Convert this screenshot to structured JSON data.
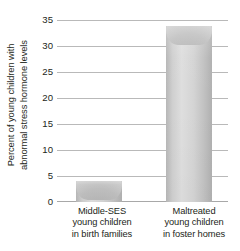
{
  "chart_data": {
    "type": "bar",
    "title": "",
    "subtitle": "",
    "xlabel": "",
    "ylabel_line1": "Percent of young children with",
    "ylabel_line2": "abnormal stress hormone levels",
    "ylabel": "Percent of young children with abnormal stress hormone levels",
    "categories": [
      "Middle-SES young children in birth families",
      "Maltreated young children in foster homes"
    ],
    "category_lines": [
      [
        "Middle-SES",
        "young children",
        "in birth families"
      ],
      [
        "Maltreated",
        "young children",
        "in foster homes"
      ]
    ],
    "values": [
      4,
      34
    ],
    "ylim": [
      0,
      35
    ],
    "ytick_step": 5,
    "yticks": [
      35,
      30,
      25,
      20,
      15,
      10,
      5,
      0
    ],
    "ytick_labels": [
      "35",
      "30",
      "25",
      "20",
      "15",
      "10",
      "5",
      "0"
    ],
    "grid": true,
    "grid_orientation": "horizontal",
    "legend": false,
    "legend_position": "none",
    "bar_color": "#cfcfcf",
    "grid_color": "#b9b9b9",
    "text_color": "#231f20",
    "background_color": "#ffffff"
  }
}
